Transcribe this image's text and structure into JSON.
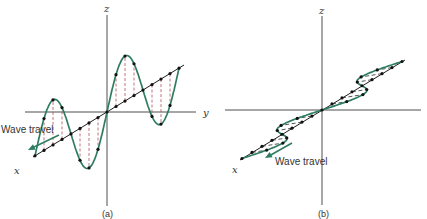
{
  "figure": {
    "panels": [
      {
        "id": "a",
        "caption": "(a)",
        "polarization": "vertical",
        "axis_labels": {
          "z": "z",
          "y": "y",
          "x": "x"
        },
        "wave_travel_label": "Wave travel",
        "origin": [
          107,
          112
        ],
        "z_axis": {
          "top": 15,
          "bottom": 206
        },
        "y_axis": {
          "left": 25,
          "right": 196
        },
        "prop_axis": {
          "start": [
            33,
            157
          ],
          "end": [
            184,
            65
          ]
        },
        "wave": {
          "start_t": -2.0,
          "end_t": 2.0,
          "amplitude": 45,
          "half_wave_px": 36
        },
        "label_pos": {
          "z": [
            104,
            12
          ],
          "y": [
            203,
            116
          ],
          "x": [
            14,
            174
          ],
          "caption": [
            102,
            217
          ],
          "wave_travel": [
            1,
            133
          ]
        },
        "arrow": {
          "from": [
            59,
            135
          ],
          "to": [
            28,
            150
          ]
        }
      },
      {
        "id": "b",
        "caption": "(b)",
        "polarization": "horizontal",
        "axis_labels": {
          "z": "z",
          "y": "",
          "x": "x"
        },
        "wave_travel_label": "Wave travel",
        "origin": [
          322,
          110
        ],
        "z_axis": {
          "top": 16,
          "bottom": 205
        },
        "y_axis": {
          "left": 225,
          "right": 421
        },
        "prop_axis": {
          "start": [
            240,
            160
          ],
          "end": [
            405,
            60
          ]
        },
        "wave": {
          "start_t": -2.0,
          "end_t": 2.0,
          "amplitude": 22,
          "half_wave_px": 40
        },
        "label_pos": {
          "z": [
            319,
            14
          ],
          "x": [
            232,
            173
          ],
          "caption": [
            318,
            217
          ],
          "wave_travel": [
            275,
            165
          ]
        },
        "arrow": {
          "from": [
            292,
            143
          ],
          "to": [
            265,
            158
          ]
        }
      }
    ],
    "colors": {
      "wave": "#2e7d62",
      "axis": "#3a3a3a",
      "dashed_vertical": "#b0505a",
      "dashed_horizontal": "#2a2a2a"
    }
  }
}
